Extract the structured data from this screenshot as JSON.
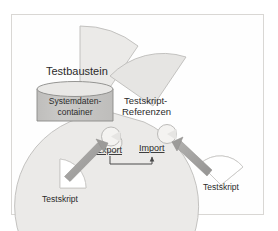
{
  "diagram": {
    "nodes": {
      "testbaustein": {
        "label": "Testbaustein",
        "shape": "pacman-circle",
        "fill": "#ebeae8",
        "stroke": "#bdbcba"
      },
      "systemdatencontainer": {
        "label_line1": "Systemdaten-",
        "label_line2": "container",
        "shape": "cylinder",
        "fill": "#c6c5c3",
        "top_fill": "#e6e5e3",
        "stroke": "#8a8a88"
      },
      "testskript_referenzen": {
        "label_line1": "Testskript-",
        "label_line2": "Referenzen",
        "shape": "pacman-circle",
        "fill": "#e6e5e3",
        "stroke": "#bdbcba"
      },
      "testskript_left": {
        "label": "Testskript",
        "shape": "pacman-circle",
        "fill": "#f2f1ef",
        "stroke": "#c9c8c6"
      },
      "testskript_right": {
        "label": "Testskript",
        "shape": "pacman-circle",
        "fill": "#f2f1ef",
        "stroke": "#c9c8c6"
      }
    },
    "ports": {
      "export": {
        "label": "Export",
        "shape": "socket",
        "fill": "#f4f3f1",
        "stroke": "#b4b3b1"
      },
      "import": {
        "label": "Import",
        "shape": "socket",
        "fill": "#f4f3f1",
        "stroke": "#b4b3b1"
      }
    },
    "connectors": {
      "left_arrow": {
        "from": "testskript_left",
        "to": "export",
        "color": "#a3a2a0"
      },
      "right_arrow": {
        "from": "testskript_right",
        "to": "import",
        "color": "#a3a2a0"
      },
      "export_to_import": {
        "from": "export",
        "to": "import",
        "color": "#4a4a4a"
      }
    },
    "colors": {
      "background": "#ffffff",
      "frame_border": "#d9d7d4",
      "text": "#2b2b2b",
      "arrow_gray": "#a3a2a0"
    }
  }
}
